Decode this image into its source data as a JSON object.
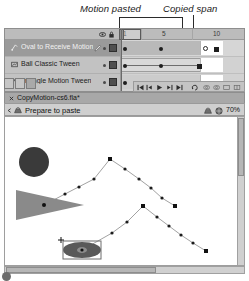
{
  "annotations": [
    {
      "id": "motion-pasted",
      "text": "Motion pasted"
    },
    {
      "id": "copied-span",
      "text": "Copied span"
    }
  ],
  "timeline": {
    "panel_name": "Timeline",
    "header_icons": [
      "eye-icon",
      "lock-icon",
      "outline-square-icon"
    ],
    "ruler": {
      "ticks": [
        "1",
        "5",
        "10"
      ],
      "frame_width_px": 10.3,
      "playhead_frame": 1
    },
    "layers": [
      {
        "name": "Oval to Receive Motion",
        "icon": "motion-layer-icon",
        "selected": true,
        "editable": true,
        "visible": true,
        "locked": false,
        "outline_color": "#4f4f4f",
        "span_type": "motion",
        "span_start": 1,
        "span_end": 11,
        "keyframes": [
          1,
          6,
          11
        ]
      },
      {
        "name": "Ball Classic Tween",
        "icon": "classic-layer-icon",
        "selected": false,
        "editable": false,
        "visible": true,
        "locked": false,
        "outline_color": "#4f4f4f",
        "span_type": "classic",
        "span_start": 1,
        "span_end": 11,
        "keyframes": [
          1,
          6,
          11
        ]
      },
      {
        "name": "Triangle Motion Tween",
        "icon": "motion-layer-icon",
        "selected": false,
        "editable": false,
        "visible": true,
        "locked": false,
        "outline_color": "#4f4f4f",
        "span_type": "motion",
        "span_start": 1,
        "span_end": 11,
        "keyframes": [
          1,
          6,
          11
        ]
      }
    ],
    "layer_tools": [
      "new-layer-button",
      "new-folder-button",
      "delete-layer-button"
    ],
    "playback_controls": [
      "go-to-first-frame-button",
      "step-back-one-frame-button",
      "play-button",
      "step-forward-one-frame-button",
      "go-to-last-frame-button",
      "loop-playback-button",
      "onion-skin-button",
      "onion-skin-outlines-button",
      "edit-multiple-frames-button",
      "modify-onion-markers-button"
    ]
  },
  "document": {
    "tab_label": "CopyMotion-cs6.fla*",
    "close_icon": "close-icon"
  },
  "edit_bar": {
    "back_icon": "back-arrow-icon",
    "scene_icon": "scene-icon",
    "scene_label": "Prepare to paste",
    "edit_scene_icon": "edit-scene-icon",
    "edit_symbols_icon": "edit-symbols-icon",
    "zoom_level": "70%"
  },
  "stage": {
    "background": "#ffffff",
    "shapes": [
      {
        "name": "circle-shape",
        "type": "circle",
        "cx": 29,
        "cy": 45,
        "r": 15,
        "fill": "#3a3a3a"
      },
      {
        "name": "triangle-shape",
        "type": "triangle",
        "points": "11,73 79,88 11,103",
        "fill": "#8a8a8a",
        "anchor": {
          "x": 39,
          "y": 88
        }
      },
      {
        "name": "selected-oval-shape",
        "type": "ellipse",
        "cx": 77,
        "cy": 133,
        "rx": 19,
        "ry": 8,
        "fill": "#5a5a5a",
        "selected": true,
        "bbox": {
          "x": 58,
          "y": 124,
          "w": 38,
          "h": 18
        }
      }
    ],
    "motion_paths": [
      {
        "name": "triangle-motion-path",
        "points": [
          [
            39,
            88
          ],
          [
            60,
            77
          ],
          [
            89,
            62
          ],
          [
            105,
            42
          ],
          [
            120,
            52
          ],
          [
            134,
            62
          ],
          [
            146,
            71
          ],
          [
            157,
            81
          ],
          [
            170,
            89
          ]
        ]
      },
      {
        "name": "oval-motion-path",
        "points": [
          [
            77,
            133
          ],
          [
            107,
            116
          ],
          [
            122,
            105
          ],
          [
            138,
            89
          ],
          [
            152,
            100
          ],
          [
            164,
            109
          ],
          [
            176,
            118
          ],
          [
            188,
            126
          ],
          [
            201,
            134
          ]
        ]
      }
    ],
    "path_dot_color": "#1c1c1c",
    "path_line_color": "#9a9a9a"
  },
  "scrollbars": {
    "vertical": "vertical-scrollbar",
    "horizontal": "horizontal-scrollbar"
  }
}
